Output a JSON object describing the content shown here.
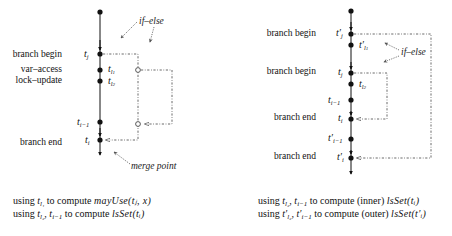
{
  "left": {
    "labels": {
      "branch_begin": "branch begin",
      "var_access": "var–access",
      "lock_update": "lock–update",
      "branch_end": "branch end"
    },
    "annotations": {
      "if_else": "if–else",
      "merge_point": "merge point"
    },
    "caption": {
      "line1": {
        "prefix": "using ",
        "var": "t",
        "var_sub": "l₁",
        "mid": " to compute ",
        "expr": "mayUse(tⱼ, x)"
      },
      "line2": {
        "prefix": "using ",
        "vars": "t",
        "vars_sub": "l₂",
        "sep": ", ",
        "var2": "t",
        "var2_sub": "i−1",
        "mid": " to compute ",
        "expr": "lsSet(tᵢ)"
      }
    }
  },
  "right": {
    "labels": {
      "branch_begin_outer": "branch begin",
      "branch_begin_inner": "branch begin",
      "branch_end_inner": "branch end",
      "branch_end_outer": "branch end"
    },
    "annotations": {
      "if_else": "if–else"
    },
    "caption": {
      "line1": {
        "prefix": "using ",
        "vars": "t",
        "vars_sub": "l₂",
        "sep": ", ",
        "var2": "t",
        "var2_sub": "i−1",
        "mid": " to compute (inner) ",
        "expr": "lsSet(tᵢ)"
      },
      "line2": {
        "prefix": "using ",
        "vars": "t′",
        "vars_sub": "l₂",
        "sep": ", ",
        "var2": "t′",
        "var2_sub": "i−1",
        "mid": " to compute (outer) ",
        "expr": "lsSet(t′ᵢ)"
      }
    }
  },
  "colors": {
    "line": "#111111",
    "dashed": "#444444",
    "annotation": "#555555"
  }
}
